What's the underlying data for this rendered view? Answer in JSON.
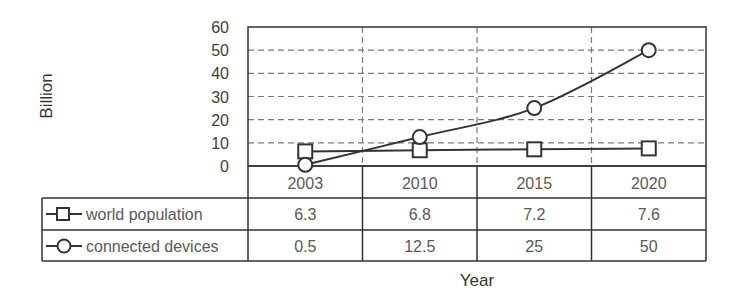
{
  "chart_data": {
    "type": "line",
    "title": "",
    "xlabel": "Year",
    "ylabel": "Billion",
    "categories": [
      "2003",
      "2010",
      "2015",
      "2020"
    ],
    "ylim": [
      0,
      60
    ],
    "yticks": [
      0,
      10,
      20,
      30,
      40,
      50,
      60
    ],
    "grid": true,
    "legend_position": "data-table",
    "series": [
      {
        "name": "world population",
        "marker": "square",
        "values": [
          6.3,
          6.8,
          7.2,
          7.6
        ],
        "labels": [
          "6.3",
          "6.8",
          "7.2",
          "7.6"
        ]
      },
      {
        "name": "connected devices",
        "marker": "circle",
        "values": [
          0.5,
          12.5,
          25,
          50
        ],
        "labels": [
          "0.5",
          "12.5",
          "25",
          "50"
        ]
      }
    ]
  },
  "colors": {
    "line": "#333333",
    "grid": "#7a7a7a",
    "text": "#595959"
  }
}
